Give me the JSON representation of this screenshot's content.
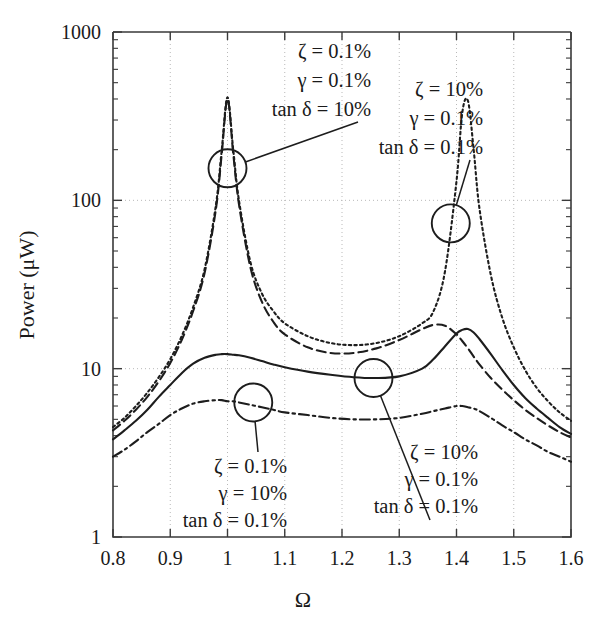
{
  "chart_data": {
    "type": "line",
    "title": "",
    "xlabel": "Ω",
    "ylabel": "Power (μW)",
    "xlim": [
      0.8,
      1.6
    ],
    "ylim": [
      1,
      1000
    ],
    "yscale": "log",
    "xscale": "linear",
    "grid": true,
    "legend_position": "none",
    "xticks": [
      "0.8",
      "0.9",
      "1",
      "1.1",
      "1.2",
      "1.3",
      "1.4",
      "1.5",
      "1.6"
    ],
    "xtick_values": [
      0.8,
      0.9,
      1.0,
      1.1,
      1.2,
      1.3,
      1.4,
      1.5,
      1.6
    ],
    "yticks": [
      "1",
      "10",
      "100",
      "1000"
    ],
    "ytick_values": [
      1,
      10,
      100,
      1000
    ],
    "x": [
      0.8,
      0.82,
      0.84,
      0.86,
      0.88,
      0.9,
      0.92,
      0.94,
      0.96,
      0.98,
      0.99,
      1.0,
      1.01,
      1.02,
      1.04,
      1.06,
      1.08,
      1.1,
      1.14,
      1.18,
      1.22,
      1.26,
      1.3,
      1.34,
      1.36,
      1.38,
      1.4,
      1.41,
      1.42,
      1.43,
      1.44,
      1.46,
      1.48,
      1.5,
      1.52,
      1.54,
      1.56,
      1.58,
      1.6
    ],
    "series": [
      {
        "name": "ζ = 0.1%, γ = 0.1%, tan δ = 10%",
        "style": "dashed",
        "values": [
          4.3,
          4.9,
          5.7,
          6.8,
          8.4,
          10.8,
          14.8,
          22.0,
          37.0,
          90.0,
          190.0,
          400.0,
          190.0,
          95.0,
          40.0,
          25.0,
          19.0,
          16.0,
          13.4,
          12.4,
          12.4,
          13.2,
          14.8,
          17.2,
          18.2,
          18.0,
          16.0,
          14.6,
          13.2,
          11.8,
          10.6,
          8.8,
          7.5,
          6.5,
          5.7,
          5.1,
          4.6,
          4.2,
          3.9
        ]
      },
      {
        "name": "ζ = 10%, γ = 0.1%, tan δ = 0.1%",
        "style": "dotted",
        "values": [
          4.5,
          5.1,
          6.0,
          7.2,
          8.9,
          11.4,
          15.6,
          23.2,
          39.0,
          95.0,
          200.0,
          410.0,
          200.0,
          100.0,
          43.0,
          28.0,
          22.0,
          18.6,
          15.6,
          14.2,
          13.8,
          14.2,
          15.6,
          18.6,
          22.0,
          38.0,
          130.0,
          330.0,
          390.0,
          200.0,
          90.0,
          36.0,
          20.0,
          13.4,
          9.8,
          7.7,
          6.4,
          5.5,
          4.9
        ]
      },
      {
        "name": "ζ = 10%, γ = 0.1%, tan δ = 0.1% (solid)",
        "style": "solid",
        "values": [
          3.8,
          4.3,
          4.9,
          5.7,
          6.8,
          8.0,
          9.4,
          10.7,
          11.6,
          12.1,
          12.2,
          12.2,
          12.1,
          12.0,
          11.6,
          11.1,
          10.6,
          10.2,
          9.6,
          9.2,
          8.9,
          8.8,
          9.0,
          10.0,
          11.4,
          13.6,
          16.2,
          17.0,
          17.2,
          16.4,
          15.0,
          12.2,
          9.8,
          8.0,
          6.7,
          5.8,
          5.1,
          4.5,
          4.1
        ]
      },
      {
        "name": "ζ = 0.1%, γ = 10%, tan δ = 0.1%",
        "style": "dashdot",
        "values": [
          3.0,
          3.3,
          3.7,
          4.2,
          4.7,
          5.3,
          5.8,
          6.2,
          6.4,
          6.5,
          6.5,
          6.4,
          6.4,
          6.3,
          6.1,
          5.9,
          5.7,
          5.5,
          5.3,
          5.1,
          5.0,
          5.0,
          5.1,
          5.4,
          5.6,
          5.8,
          6.0,
          6.0,
          5.9,
          5.8,
          5.6,
          5.1,
          4.6,
          4.2,
          3.8,
          3.5,
          3.2,
          3.0,
          2.8
        ]
      }
    ],
    "annotations": [
      {
        "id": "ann-top-left",
        "lines": [
          "ζ = 0.1%",
          "γ = 0.1%",
          "tan δ = 10%"
        ],
        "align": "right"
      },
      {
        "id": "ann-top-right",
        "lines": [
          "ζ = 10%",
          "γ = 0.1%",
          "tan δ = 0.1%"
        ],
        "align": "right"
      },
      {
        "id": "ann-bot-left",
        "lines": [
          "ζ = 0.1%",
          "γ = 10%",
          "tan δ = 0.1%"
        ],
        "align": "right"
      },
      {
        "id": "ann-bot-right",
        "lines": [
          "ζ = 10%",
          "γ = 0.1%",
          "tan δ = 0.1%"
        ],
        "align": "right"
      }
    ],
    "callout_circles": [
      {
        "id": "callout-top-left",
        "x": 1.0,
        "y": 155
      },
      {
        "id": "callout-top-right",
        "x": 1.39,
        "y": 73
      },
      {
        "id": "callout-bot-left",
        "x": 1.045,
        "y": 6.3
      },
      {
        "id": "callout-bot-right",
        "x": 1.255,
        "y": 8.8
      }
    ],
    "colors": {
      "curve": "#1d1d1d",
      "axis": "#3a3a3a",
      "grid": "#b9b9b9",
      "background": "#ffffff"
    }
  },
  "annotation_text": {
    "top_left": {
      "l1": "ζ = 0.1%",
      "l2": "γ = 0.1%",
      "l3": "tan δ = 10%"
    },
    "top_right": {
      "l1": "ζ = 10%",
      "l2": "γ = 0.1%",
      "l3": "tan δ = 0.1%"
    },
    "bot_left": {
      "l1": "ζ = 0.1%",
      "l2": "γ = 10%",
      "l3": "tan δ = 0.1%"
    },
    "bot_right": {
      "l1": "ζ = 10%",
      "l2": "γ = 0.1%",
      "l3": "tan δ = 0.1%"
    }
  },
  "axes": {
    "y_title": "Power (μW)",
    "x_title": "Ω"
  }
}
